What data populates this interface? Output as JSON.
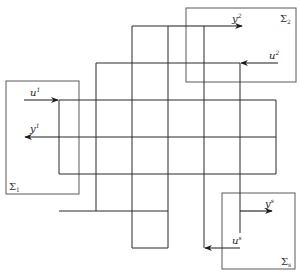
{
  "diagram": {
    "type": "interconnected-subsystems-grid",
    "colors": {
      "wire": "#2a2a2a",
      "box": "#5a5a5a",
      "background": "#ffffff"
    },
    "subsystems": [
      {
        "id": "sigma1",
        "label": "Σ",
        "sub": "1",
        "box": [
          18,
          81,
          79,
          194
        ]
      },
      {
        "id": "sigma2",
        "label": "Σ",
        "sub": "2",
        "box": [
          186,
          8,
          296,
          82
        ]
      },
      {
        "id": "sigmas",
        "label": "Σ",
        "sub": "s",
        "box": [
          222,
          193,
          295,
          269
        ]
      }
    ],
    "signals": [
      {
        "id": "u1",
        "label": "u",
        "sup": "1",
        "direction": "in",
        "subsystem": "sigma1",
        "arrow": "right"
      },
      {
        "id": "y1",
        "label": "y",
        "sup": "1",
        "direction": "out",
        "subsystem": "sigma1",
        "arrow": "left"
      },
      {
        "id": "y2",
        "label": "y",
        "sup": "2",
        "direction": "out",
        "subsystem": "sigma2",
        "arrow": "right"
      },
      {
        "id": "u2",
        "label": "u",
        "sup": "2",
        "direction": "in",
        "subsystem": "sigma2",
        "arrow": "left"
      },
      {
        "id": "ys",
        "label": "y",
        "sup": "s",
        "direction": "out",
        "subsystem": "sigmas",
        "arrow": "right"
      },
      {
        "id": "us",
        "label": "u",
        "sup": "s",
        "direction": "in",
        "subsystem": "sigmas",
        "arrow": "left"
      }
    ],
    "grid": {
      "vertical_x": [
        59,
        96,
        132,
        168,
        204,
        240,
        276
      ],
      "horizontal_y": [
        26,
        63,
        100,
        137,
        174,
        211,
        248
      ]
    }
  }
}
